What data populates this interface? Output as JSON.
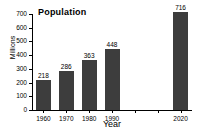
{
  "chart_data": {
    "type": "bar",
    "title": "Population",
    "xlabel": "Year",
    "ylabel": "Millions",
    "categories": [
      "1960",
      "1970",
      "1980",
      "1990",
      "2020"
    ],
    "values": [
      218,
      286,
      363,
      448,
      716
    ],
    "value_labels": [
      "218",
      "286",
      "363",
      "448",
      "716"
    ],
    "ylim": [
      0,
      700
    ],
    "ytick_labels": [
      "0",
      "100",
      "200",
      "300",
      "400",
      "500",
      "600",
      "700"
    ],
    "ytick_values": [
      0,
      100,
      200,
      300,
      400,
      500,
      600,
      700
    ],
    "grid": false,
    "legend": false,
    "bar_color": "#3d3d3d",
    "axis_color": "#000000",
    "background": "#ffffff",
    "missing_categories": [
      "2000",
      "2010"
    ]
  }
}
